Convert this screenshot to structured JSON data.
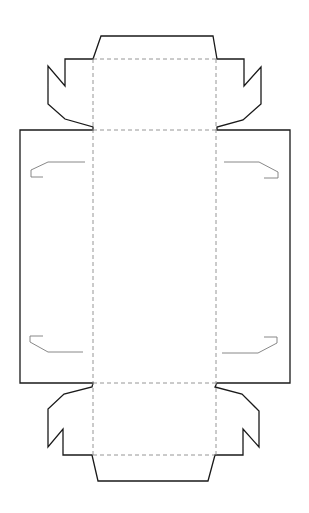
{
  "diagram": {
    "type": "box-dieline",
    "background": "#ffffff",
    "colors": {
      "cut_line": "#1a1a1a",
      "fold_line": "#8a8a8a",
      "slot_line": "#7a7a7a"
    },
    "outline": {
      "description": "Outer cut line of box net",
      "points": "101,36 213,36 217,59 244,59 244,86 261,67 261,104 243,120 217,127 217,130 290,130 290,383 217,383 215,387 242,394 259,411 259,447 243,429 243,455 215,455 208,481 98,481 92,455 63,455 63,429 48,447 48,409 64,394 92,387 93,383 20,383 20,130 93,130 93,127 65,119 48,104 48,66 65,86 65,59 93,59"
    },
    "fold_lines": [
      {
        "name": "fold-top-flap",
        "x1": 93,
        "y1": 59,
        "x2": 217,
        "y2": 59
      },
      {
        "name": "fold-top-panel",
        "x1": 93,
        "y1": 130,
        "x2": 217,
        "y2": 130
      },
      {
        "name": "fold-bottom-panel",
        "x1": 93,
        "y1": 383,
        "x2": 217,
        "y2": 383
      },
      {
        "name": "fold-bottom-flap",
        "x1": 93,
        "y1": 455,
        "x2": 215,
        "y2": 455
      },
      {
        "name": "fold-left-vertical",
        "x1": 93,
        "y1": 59,
        "x2": 93,
        "y2": 455
      },
      {
        "name": "fold-right-vertical",
        "x1": 216,
        "y1": 59,
        "x2": 216,
        "y2": 455
      }
    ],
    "slots": [
      {
        "name": "slot-top-left",
        "points": "85,162 48,162 31,170 31,177 43,177"
      },
      {
        "name": "slot-top-right",
        "points": "224,162 259,162 278,172 278,178 264,178"
      },
      {
        "name": "slot-bottom-left",
        "points": "43,336 30,336 30,342 48,352 83,352"
      },
      {
        "name": "slot-bottom-right",
        "points": "264,337 277,337 277,343 258,353 222,353"
      }
    ]
  }
}
